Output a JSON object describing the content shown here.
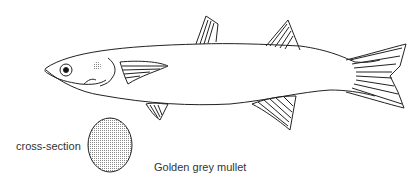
{
  "labels": {
    "cross_section": "cross-section",
    "species": "Golden grey mullet"
  }
}
